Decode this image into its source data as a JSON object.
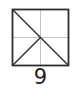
{
  "diagram": {
    "label": "9",
    "square": {
      "x": 12,
      "y": 9,
      "size": 57
    },
    "colors": {
      "stroke": "#333333",
      "guide": "#bbbbbb",
      "background": "#ffffff"
    },
    "lines": [
      {
        "name": "vertical-midline",
        "style": "guide"
      },
      {
        "name": "horizontal-midline",
        "style": "guide"
      },
      {
        "name": "diagonal-topleft-bottomright",
        "style": "stroke"
      },
      {
        "name": "center-to-bottomleft",
        "style": "stroke"
      }
    ]
  }
}
